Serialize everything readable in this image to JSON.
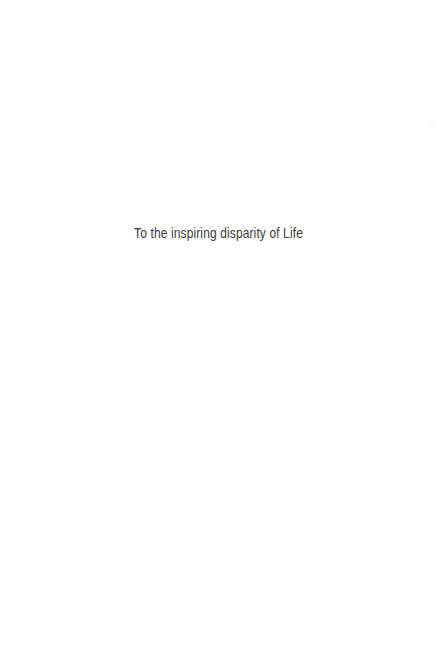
{
  "page": {
    "width": 438,
    "height": 667,
    "background_color": "#ffffff",
    "kind": "book-dedication-page"
  },
  "dedication": {
    "text": "To the inspiring disparity of Life",
    "text_color": "#3a3a3a",
    "alignment": "center"
  },
  "artifacts": {
    "scan_speck": {
      "color": "#fbfbfb"
    }
  }
}
